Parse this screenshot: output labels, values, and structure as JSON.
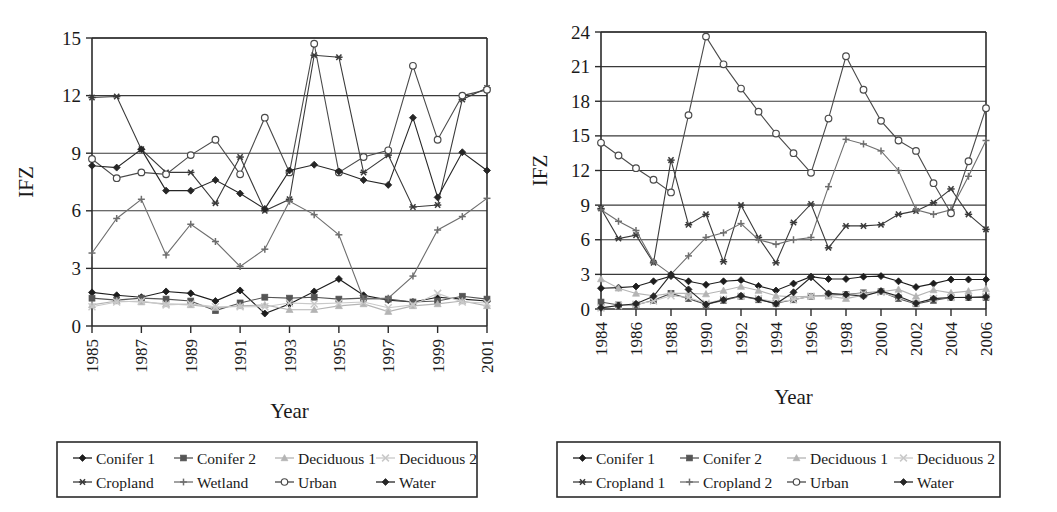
{
  "figure": {
    "title": "",
    "panels": [
      "left",
      "right"
    ]
  },
  "chart_data": [
    {
      "id": "left-chart",
      "type": "line",
      "title": "",
      "xlabel": "Year",
      "ylabel": "IFZ",
      "xlim": [
        1985,
        2001
      ],
      "ylim": [
        0,
        15
      ],
      "yticks": [
        0,
        3,
        6,
        9,
        12,
        15
      ],
      "xticks": [
        1985,
        1987,
        1989,
        1991,
        1993,
        1995,
        1997,
        1999,
        2001
      ],
      "x": [
        1985,
        1986,
        1987,
        1988,
        1989,
        1990,
        1991,
        1992,
        1993,
        1994,
        1995,
        1996,
        1997,
        1998,
        1999,
        2000,
        2001
      ],
      "grid": "horizontal",
      "legend_position": "below",
      "series": [
        {
          "name": "Conifer 1",
          "marker": "diamond-filled",
          "color": "#1d1d1d",
          "values": [
            1.75,
            1.6,
            1.5,
            1.8,
            1.7,
            1.3,
            1.85,
            0.65,
            1.15,
            1.8,
            2.45,
            1.6,
            1.35,
            1.25,
            1.5,
            1.4,
            1.3
          ]
        },
        {
          "name": "Conifer 2",
          "marker": "square-filled",
          "color": "#555555",
          "values": [
            1.45,
            1.35,
            1.45,
            1.4,
            1.3,
            0.8,
            1.2,
            1.5,
            1.45,
            1.5,
            1.4,
            1.45,
            1.4,
            1.25,
            1.3,
            1.55,
            1.4
          ]
        },
        {
          "name": "Deciduous 1",
          "marker": "triangle-filled",
          "color": "#b4b4b4",
          "values": [
            1.1,
            1.3,
            1.25,
            1.15,
            1.1,
            0.95,
            1.05,
            1.1,
            0.85,
            0.85,
            1.05,
            1.15,
            0.75,
            1.05,
            1.15,
            1.3,
            1.05
          ]
        },
        {
          "name": "Deciduous 2",
          "marker": "cross-x",
          "color": "#c9c9c9",
          "values": [
            1.0,
            1.25,
            1.3,
            1.1,
            1.15,
            1.0,
            1.0,
            1.0,
            1.2,
            1.15,
            1.2,
            1.25,
            0.95,
            1.1,
            1.7,
            1.25,
            1.2
          ]
        },
        {
          "name": "Cropland",
          "marker": "asterisk",
          "color": "#3a3a3a",
          "values": [
            11.9,
            11.95,
            9.2,
            8.0,
            8.0,
            6.4,
            8.8,
            6.0,
            6.6,
            14.1,
            14.0,
            8.0,
            8.9,
            6.2,
            6.3,
            11.8,
            12.4
          ]
        },
        {
          "name": "Wetland",
          "marker": "plus",
          "color": "#6e6e6e",
          "values": [
            3.8,
            5.6,
            6.6,
            3.7,
            5.3,
            4.4,
            3.1,
            4.0,
            6.5,
            5.8,
            4.75,
            1.4,
            1.45,
            2.6,
            5.0,
            5.7,
            6.65
          ]
        },
        {
          "name": "Urban",
          "marker": "circle-open",
          "color": "#4a4a4a",
          "values": [
            8.7,
            7.7,
            8.0,
            7.9,
            8.9,
            9.7,
            7.9,
            10.85,
            8.0,
            14.7,
            8.0,
            8.8,
            9.15,
            13.55,
            9.7,
            12.0,
            12.3
          ]
        },
        {
          "name": "Water",
          "marker": "diamond-filled",
          "color": "#262626",
          "values": [
            8.35,
            8.25,
            9.2,
            7.05,
            7.05,
            7.6,
            6.9,
            6.1,
            8.1,
            8.4,
            8.05,
            7.6,
            7.35,
            10.85,
            6.7,
            9.05,
            8.1
          ]
        }
      ]
    },
    {
      "id": "right-chart",
      "type": "line",
      "title": "",
      "xlabel": "Year",
      "ylabel": "IFZ",
      "xlim": [
        1984,
        2006
      ],
      "ylim": [
        0,
        24
      ],
      "yticks": [
        0,
        3,
        6,
        9,
        12,
        15,
        18,
        21,
        24
      ],
      "xticks": [
        1984,
        1986,
        1988,
        1990,
        1992,
        1994,
        1996,
        1998,
        2000,
        2002,
        2004,
        2006
      ],
      "x": [
        1984,
        1985,
        1986,
        1987,
        1988,
        1989,
        1990,
        1991,
        1992,
        1993,
        1994,
        1995,
        1996,
        1997,
        1998,
        1999,
        2000,
        2001,
        2002,
        2003,
        2004,
        2005,
        2006
      ],
      "grid": "horizontal",
      "legend_position": "below",
      "series": [
        {
          "name": "Conifer 1",
          "marker": "diamond-filled",
          "color": "#1d1d1d",
          "values": [
            1.8,
            1.85,
            1.95,
            2.4,
            2.85,
            2.4,
            2.1,
            2.4,
            2.5,
            2.0,
            1.6,
            2.2,
            2.8,
            2.6,
            2.6,
            2.8,
            2.85,
            2.4,
            1.9,
            2.2,
            2.55,
            2.55,
            2.55
          ]
        },
        {
          "name": "Conifer 2",
          "marker": "square-filled",
          "color": "#555555",
          "values": [
            0.6,
            0.35,
            0.35,
            0.75,
            1.35,
            0.9,
            0.4,
            0.75,
            1.1,
            0.8,
            0.5,
            0.8,
            1.1,
            1.2,
            1.25,
            1.4,
            1.5,
            0.9,
            0.45,
            0.75,
            1.0,
            1.0,
            1.0
          ]
        },
        {
          "name": "Deciduous 1",
          "marker": "triangle-filled",
          "color": "#b4b4b4",
          "values": [
            2.6,
            1.8,
            1.35,
            1.15,
            1.35,
            1.35,
            1.3,
            1.6,
            1.95,
            1.6,
            1.15,
            1.05,
            1.1,
            1.1,
            0.9,
            1.2,
            1.5,
            1.7,
            1.1,
            1.65,
            1.4,
            1.55,
            1.75
          ]
        },
        {
          "name": "Deciduous 2",
          "marker": "cross-x",
          "color": "#c9c9c9",
          "values": [
            0.1,
            0.3,
            0.4,
            0.7,
            1.15,
            1.0,
            0.5,
            0.85,
            1.1,
            0.9,
            0.6,
            0.8,
            1.1,
            1.15,
            1.2,
            1.35,
            1.45,
            1.0,
            0.5,
            0.9,
            1.0,
            1.05,
            1.1
          ]
        },
        {
          "name": "Cropland 1",
          "marker": "asterisk",
          "color": "#3a3a3a",
          "values": [
            8.7,
            6.1,
            6.4,
            4.0,
            12.9,
            7.3,
            8.2,
            4.1,
            9.0,
            6.2,
            4.0,
            7.5,
            9.1,
            5.3,
            7.2,
            7.2,
            7.3,
            8.2,
            8.5,
            9.2,
            10.4,
            8.2,
            6.9
          ]
        },
        {
          "name": "Cropland 2",
          "marker": "plus",
          "color": "#6e6e6e",
          "values": [
            8.6,
            7.6,
            6.8,
            4.1,
            3.0,
            4.6,
            6.2,
            6.6,
            7.4,
            6.0,
            5.6,
            6.0,
            6.2,
            10.6,
            14.7,
            14.3,
            13.7,
            12.0,
            8.6,
            8.2,
            8.6,
            11.5,
            14.6
          ]
        },
        {
          "name": "Urban",
          "marker": "circle-open",
          "color": "#4a4a4a",
          "values": [
            14.4,
            13.3,
            12.2,
            11.2,
            10.1,
            16.8,
            23.6,
            21.2,
            19.1,
            17.1,
            15.2,
            13.5,
            11.8,
            16.5,
            21.9,
            19.0,
            16.3,
            14.6,
            13.7,
            10.9,
            8.3,
            12.8,
            17.4
          ]
        },
        {
          "name": "Water",
          "marker": "diamond-filled",
          "color": "#262626",
          "values": [
            0.1,
            0.3,
            0.45,
            1.1,
            3.0,
            1.7,
            0.4,
            0.8,
            1.15,
            0.85,
            0.45,
            1.45,
            2.75,
            1.35,
            1.25,
            1.1,
            1.55,
            1.1,
            0.5,
            0.9,
            1.0,
            1.0,
            1.05
          ]
        }
      ]
    }
  ],
  "legends": [
    {
      "id": "left-legend",
      "entries": [
        {
          "label": "Conifer 1",
          "marker": "diamond-filled",
          "color": "#1d1d1d"
        },
        {
          "label": "Conifer 2",
          "marker": "square-filled",
          "color": "#555555"
        },
        {
          "label": "Deciduous 1",
          "marker": "triangle-filled",
          "color": "#b4b4b4"
        },
        {
          "label": "Deciduous 2",
          "marker": "cross-x",
          "color": "#c9c9c9"
        },
        {
          "label": "Cropland",
          "marker": "asterisk",
          "color": "#3a3a3a"
        },
        {
          "label": "Wetland",
          "marker": "plus",
          "color": "#6e6e6e"
        },
        {
          "label": "Urban",
          "marker": "circle-open",
          "color": "#4a4a4a"
        },
        {
          "label": "Water",
          "marker": "diamond-filled",
          "color": "#262626"
        }
      ]
    },
    {
      "id": "right-legend",
      "entries": [
        {
          "label": "Conifer 1",
          "marker": "diamond-filled",
          "color": "#1d1d1d"
        },
        {
          "label": "Conifer 2",
          "marker": "square-filled",
          "color": "#555555"
        },
        {
          "label": "Deciduous 1",
          "marker": "triangle-filled",
          "color": "#b4b4b4"
        },
        {
          "label": "Deciduous 2",
          "marker": "cross-x",
          "color": "#c9c9c9"
        },
        {
          "label": "Cropland 1",
          "marker": "asterisk",
          "color": "#3a3a3a"
        },
        {
          "label": "Cropland 2",
          "marker": "plus",
          "color": "#6e6e6e"
        },
        {
          "label": "Urban",
          "marker": "circle-open",
          "color": "#4a4a4a"
        },
        {
          "label": "Water",
          "marker": "diamond-filled",
          "color": "#262626"
        }
      ]
    }
  ]
}
